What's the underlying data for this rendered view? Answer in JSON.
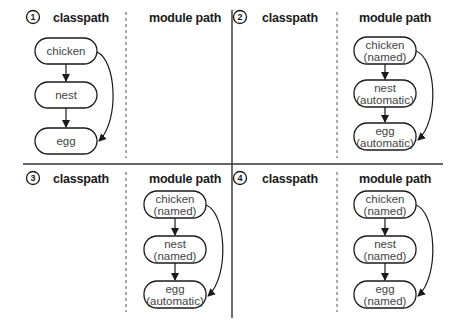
{
  "diagram": {
    "column_headers": {
      "left": "classpath",
      "right": "module path"
    },
    "panels": [
      {
        "number": "1",
        "classpath_nodes": [
          {
            "name": "chicken",
            "type": ""
          },
          {
            "name": "nest",
            "type": ""
          },
          {
            "name": "egg",
            "type": ""
          }
        ],
        "module_path_nodes": []
      },
      {
        "number": "2",
        "classpath_nodes": [],
        "module_path_nodes": [
          {
            "name": "chicken",
            "type": "(named)"
          },
          {
            "name": "nest",
            "type": "(automatic)"
          },
          {
            "name": "egg",
            "type": "(automatic)"
          }
        ]
      },
      {
        "number": "3",
        "classpath_nodes": [],
        "module_path_nodes": [
          {
            "name": "chicken",
            "type": "(named)"
          },
          {
            "name": "nest",
            "type": "(named)"
          },
          {
            "name": "egg",
            "type": "(automatic)"
          }
        ]
      },
      {
        "number": "4",
        "classpath_nodes": [],
        "module_path_nodes": [
          {
            "name": "chicken",
            "type": "(named)"
          },
          {
            "name": "nest",
            "type": "(named)"
          },
          {
            "name": "egg",
            "type": "(named)"
          }
        ]
      }
    ],
    "edges": [
      {
        "from": "chicken",
        "to": "nest"
      },
      {
        "from": "nest",
        "to": "egg"
      },
      {
        "from": "chicken",
        "to": "egg"
      }
    ]
  }
}
